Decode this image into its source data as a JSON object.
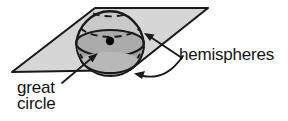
{
  "diagram": {
    "labels": {
      "hemispheres": "hemispheres",
      "great": "great",
      "circle": "circle"
    },
    "colors": {
      "stroke": "#1a1a1a",
      "plane_fill": "#d4d4d4",
      "upper_dome_fill": "#c2c2c2",
      "lower_band_fill": "#9e9e9e",
      "bottom_cap_fill": "#b5b5b5",
      "center_dot": "#000000",
      "text": "#141414",
      "background": "#ffffff"
    },
    "geometry": {
      "plane_points": "12,72 95,8 208,8 130,70",
      "sphere_center_x": 110,
      "sphere_center_y": 41,
      "sphere_radius_x": 34,
      "sphere_radius_y": 36,
      "great_circle_rx": 34,
      "great_circle_ry": 13,
      "center_dot_radius": 4,
      "dashed_arc_count": 2
    },
    "parts": {
      "upper_hemisphere": "upper hemisphere (solid dome above plane)",
      "lower_hemisphere": "lower hemisphere (below plane)",
      "great_circle": "great circle where plane meets sphere",
      "center_point": "center of sphere"
    },
    "annotations": [
      {
        "label": "hemispheres",
        "targets": [
          "upper hemisphere",
          "lower hemisphere"
        ],
        "arrows": 2
      },
      {
        "label": "great circle",
        "targets": [
          "great circle"
        ],
        "arrows": 1
      }
    ]
  }
}
